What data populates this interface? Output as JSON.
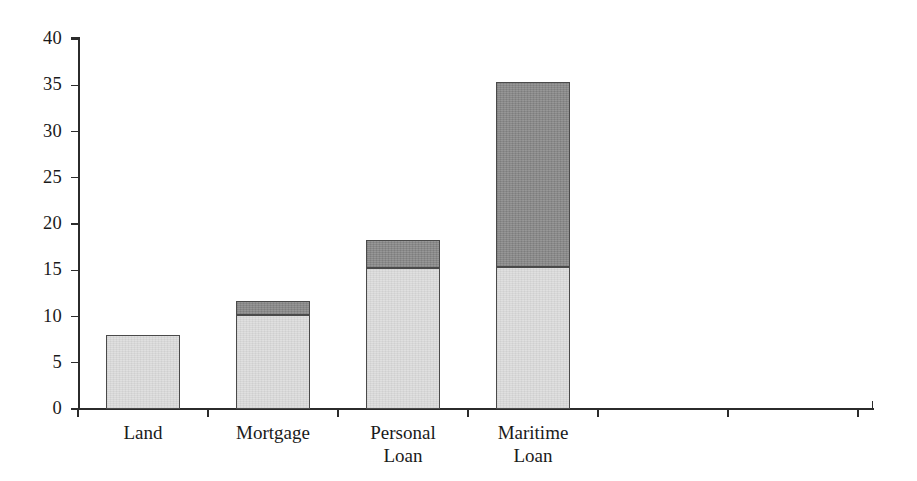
{
  "chart_data": {
    "type": "bar",
    "subtype": "stacked",
    "title": "",
    "xlabel": "",
    "ylabel": "",
    "categories": [
      "Land",
      "Mortgage",
      "Personal\nLoan",
      "Maritime\nLoan"
    ],
    "category_labels_flat": [
      "Land",
      "Mortgage",
      "Personal Loan",
      "Maritime Loan"
    ],
    "series": [
      {
        "name": "light-segment",
        "color": "#dedede",
        "values": [
          8.0,
          10.2,
          15.2,
          15.3
        ]
      },
      {
        "name": "dark-segment",
        "color": "#8c8c8c",
        "values": [
          0.0,
          1.5,
          3.1,
          20.0
        ]
      }
    ],
    "totals": [
      8.0,
      11.7,
      18.3,
      35.3
    ],
    "ylim": [
      0,
      40
    ],
    "yticks": [
      0,
      5,
      10,
      15,
      20,
      25,
      30,
      35,
      40
    ],
    "ytick_labels": [
      "0",
      "5",
      "10",
      "15",
      "20",
      "25",
      "30",
      "35",
      "40"
    ],
    "grid": false,
    "legend": "none",
    "empty_category_slots": 3
  },
  "axes": {
    "y_labels": [
      "40",
      "35",
      "30",
      "25",
      "20",
      "15",
      "10",
      "5",
      "0"
    ],
    "y_values": [
      40,
      35,
      30,
      25,
      20,
      15,
      10,
      5,
      0
    ]
  },
  "colors": {
    "light_fill": "#dedede",
    "dark_fill": "#8c8c8c",
    "bar_stroke": "#4a4a4a",
    "axis": "#2b2b2b",
    "background": "#ffffff",
    "text": "#1a1a1a"
  }
}
